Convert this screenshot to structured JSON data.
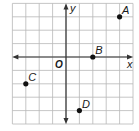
{
  "diagram": {
    "type": "coordinate-plane",
    "grid": {
      "x_min": -4,
      "x_max": 5,
      "y_min": -5,
      "y_max": 4,
      "cell_px": 13.4,
      "origin_px": [
        66,
        57
      ]
    },
    "axes": {
      "x_label": "x",
      "y_label": "y",
      "origin_label": "O"
    },
    "points": [
      {
        "label": "A",
        "x": 4,
        "y": 3
      },
      {
        "label": "B",
        "x": 2,
        "y": 0
      },
      {
        "label": "C",
        "x": -3,
        "y": -2
      },
      {
        "label": "D",
        "x": 1,
        "y": -4
      }
    ],
    "colors": {
      "grid": "#b8b8b8",
      "axis": "#333333",
      "point": "#111111",
      "background": "#ffffff"
    }
  },
  "chart_data": {
    "type": "scatter",
    "title": "",
    "xlabel": "x",
    "ylabel": "y",
    "xlim": [
      -4,
      5
    ],
    "ylim": [
      -5,
      4
    ],
    "grid": true,
    "points": [
      {
        "label": "A",
        "x": 4,
        "y": 3
      },
      {
        "label": "B",
        "x": 2,
        "y": 0
      },
      {
        "label": "C",
        "x": -3,
        "y": -2
      },
      {
        "label": "D",
        "x": 1,
        "y": -4
      }
    ]
  }
}
